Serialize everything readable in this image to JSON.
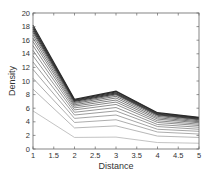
{
  "chart_data": {
    "type": "line",
    "title": "",
    "xlabel": "Distance",
    "ylabel": "Density",
    "xlim": [
      1,
      5
    ],
    "ylim": [
      0,
      20
    ],
    "grid": false,
    "legend": null,
    "x": [
      1,
      2,
      3,
      4,
      5
    ],
    "x_ticks": [
      "1",
      "1.5",
      "2",
      "2.5",
      "3",
      "3.5",
      "4",
      "4.5",
      "5"
    ],
    "y_ticks": [
      "0",
      "2",
      "4",
      "6",
      "8",
      "10",
      "12",
      "14",
      "16",
      "18",
      "20"
    ],
    "line_color_range": {
      "lightest": "#b4b4b4",
      "darkest": "#2a2a2a"
    },
    "series": [
      {
        "name": "s1",
        "values": [
          5.6,
          1.7,
          1.75,
          0.95,
          0.85
        ]
      },
      {
        "name": "s2",
        "values": [
          8.8,
          3.1,
          3.4,
          1.9,
          1.7
        ]
      },
      {
        "name": "s3",
        "values": [
          10.4,
          3.9,
          4.3,
          2.5,
          2.2
        ]
      },
      {
        "name": "s4",
        "values": [
          11.7,
          4.5,
          5.0,
          2.9,
          2.6
        ]
      },
      {
        "name": "s5",
        "values": [
          12.8,
          5.0,
          5.6,
          3.3,
          2.9
        ]
      },
      {
        "name": "s6",
        "values": [
          13.7,
          5.4,
          6.1,
          3.6,
          3.2
        ]
      },
      {
        "name": "s7",
        "values": [
          14.5,
          5.75,
          6.55,
          3.9,
          3.45
        ]
      },
      {
        "name": "s8",
        "values": [
          15.2,
          6.05,
          6.9,
          4.15,
          3.65
        ]
      },
      {
        "name": "s9",
        "values": [
          15.8,
          6.3,
          7.2,
          4.4,
          3.85
        ]
      },
      {
        "name": "s10",
        "values": [
          16.3,
          6.5,
          7.5,
          4.6,
          4.0
        ]
      },
      {
        "name": "s11",
        "values": [
          16.75,
          6.7,
          7.75,
          4.8,
          4.15
        ]
      },
      {
        "name": "s12",
        "values": [
          17.1,
          6.85,
          7.95,
          4.95,
          4.3
        ]
      },
      {
        "name": "s13",
        "values": [
          17.4,
          7.0,
          8.1,
          5.05,
          4.4
        ]
      },
      {
        "name": "s14",
        "values": [
          17.7,
          7.1,
          8.25,
          5.15,
          4.5
        ]
      },
      {
        "name": "s15",
        "values": [
          17.95,
          7.2,
          8.4,
          5.25,
          4.58
        ]
      },
      {
        "name": "s16",
        "values": [
          18.2,
          7.3,
          8.5,
          5.35,
          4.65
        ]
      }
    ]
  }
}
